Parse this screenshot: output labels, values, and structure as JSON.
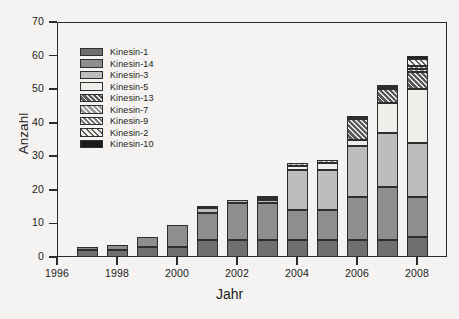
{
  "chart_data": {
    "type": "bar",
    "title": "",
    "subtitle": "",
    "xlabel": "Jahr",
    "ylabel": "Anzahl",
    "stacked": true,
    "grid": false,
    "legend_position": "top-left inside plot",
    "xlim": [
      1996,
      2009
    ],
    "ylim": [
      0,
      70
    ],
    "ytick_labels": [
      "0",
      "10",
      "20",
      "30",
      "40",
      "50",
      "60",
      "70"
    ],
    "ytick_values": [
      0,
      10,
      20,
      30,
      40,
      50,
      60,
      70
    ],
    "xtick_labels": [
      "1996",
      "1998",
      "2000",
      "2002",
      "2004",
      "2006",
      "2008"
    ],
    "xtick_values": [
      1996,
      1998,
      2000,
      2002,
      2004,
      2006,
      2008
    ],
    "categories": [
      1997,
      1998,
      1999,
      2000,
      2001,
      2002,
      2003,
      2004,
      2005,
      2006,
      2007,
      2008
    ],
    "totals": [
      3,
      3.5,
      6,
      9.5,
      15,
      17,
      18,
      28,
      29,
      42,
      51,
      60
    ],
    "series": [
      {
        "name": "Kinesin-1",
        "color": "#6f6f6f",
        "pattern": "solid",
        "values": [
          2,
          2,
          3,
          3,
          5,
          5,
          5,
          5,
          5,
          5,
          5,
          6
        ]
      },
      {
        "name": "Kinesin-14",
        "color": "#8e8e8e",
        "pattern": "solid",
        "values": [
          1,
          1.5,
          3,
          6.5,
          8,
          11,
          11,
          9,
          9,
          13,
          16,
          12
        ]
      },
      {
        "name": "Kinesin-3",
        "color": "#bdbdbd",
        "pattern": "solid",
        "values": [
          0,
          0,
          0,
          0,
          1.5,
          1,
          1,
          12,
          12,
          15,
          16,
          16
        ]
      },
      {
        "name": "Kinesin-5",
        "color": "#eeeeea",
        "pattern": "solid",
        "values": [
          0,
          0,
          0,
          0,
          0.5,
          0,
          0,
          1,
          2,
          2,
          9,
          16
        ]
      },
      {
        "name": "Kinesin-13",
        "color": "#5b5b5b",
        "pattern": "hatch-dark",
        "values": [
          0,
          0,
          0,
          0,
          0,
          0,
          0.5,
          0,
          0,
          6,
          4,
          5
        ]
      },
      {
        "name": "Kinesin-7",
        "color": "#9a9a9a",
        "pattern": "hatch-mid",
        "values": [
          0,
          0,
          0,
          0,
          0,
          0,
          0,
          1,
          1,
          0.5,
          0.5,
          1
        ]
      },
      {
        "name": "Kinesin-9",
        "color": "#c9c9c9",
        "pattern": "hatch-light",
        "values": [
          0,
          0,
          0,
          0,
          0,
          0,
          0.5,
          0,
          0,
          0,
          0.5,
          1
        ]
      },
      {
        "name": "Kinesin-2",
        "color": "#f2f2ef",
        "pattern": "hatch-outline",
        "values": [
          0,
          0,
          0,
          0,
          0,
          0,
          0,
          0,
          0,
          0.5,
          0,
          2
        ]
      },
      {
        "name": "Kinesin-10",
        "color": "#1b1b1b",
        "pattern": "solid",
        "values": [
          0,
          0,
          0,
          0,
          0,
          0,
          0,
          0,
          0,
          0,
          0,
          1
        ]
      }
    ]
  },
  "axes": {
    "ylabel": "Anzahl",
    "xlabel": "Jahr"
  },
  "legend": {
    "items": [
      {
        "label": "Kinesin-1"
      },
      {
        "label": "Kinesin-14"
      },
      {
        "label": "Kinesin-3"
      },
      {
        "label": "Kinesin-5"
      },
      {
        "label": "Kinesin-13"
      },
      {
        "label": "Kinesin-7"
      },
      {
        "label": "Kinesin-9"
      },
      {
        "label": "Kinesin-2"
      },
      {
        "label": "Kinesin-10"
      }
    ]
  }
}
